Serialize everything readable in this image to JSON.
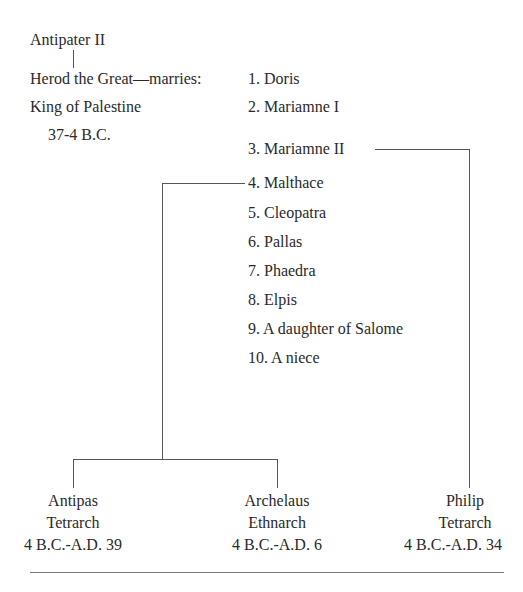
{
  "title_cutoff": "Family Tree of Herod the Great",
  "ancestor": {
    "name": "Antipater II"
  },
  "herod": {
    "name_line": "Herod the Great—marries:",
    "title": "King of Palestine",
    "reign": "37-4 B.C."
  },
  "wives": [
    "1. Doris",
    "2. Mariamne I",
    "3. Mariamne II",
    "4. Malthace",
    "5. Cleopatra",
    "6. Pallas",
    "7. Phaedra",
    "8. Elpis",
    "9. A daughter of Salome",
    "10. A niece"
  ],
  "children": [
    {
      "name": "Antipas",
      "title": "Tetrarch",
      "dates": "4 B.C.-A.D. 39",
      "mother": "4. Malthace"
    },
    {
      "name": "Archelaus",
      "title": "Ethnarch",
      "dates": "4 B.C.-A.D. 6",
      "mother": "4. Malthace"
    },
    {
      "name": "Philip",
      "title": "Tetrarch",
      "dates": "4 B.C.-A.D. 34",
      "mother": "3. Mariamne II"
    }
  ],
  "colors": {
    "text": "#2a2a2a",
    "lines": "#555555"
  }
}
